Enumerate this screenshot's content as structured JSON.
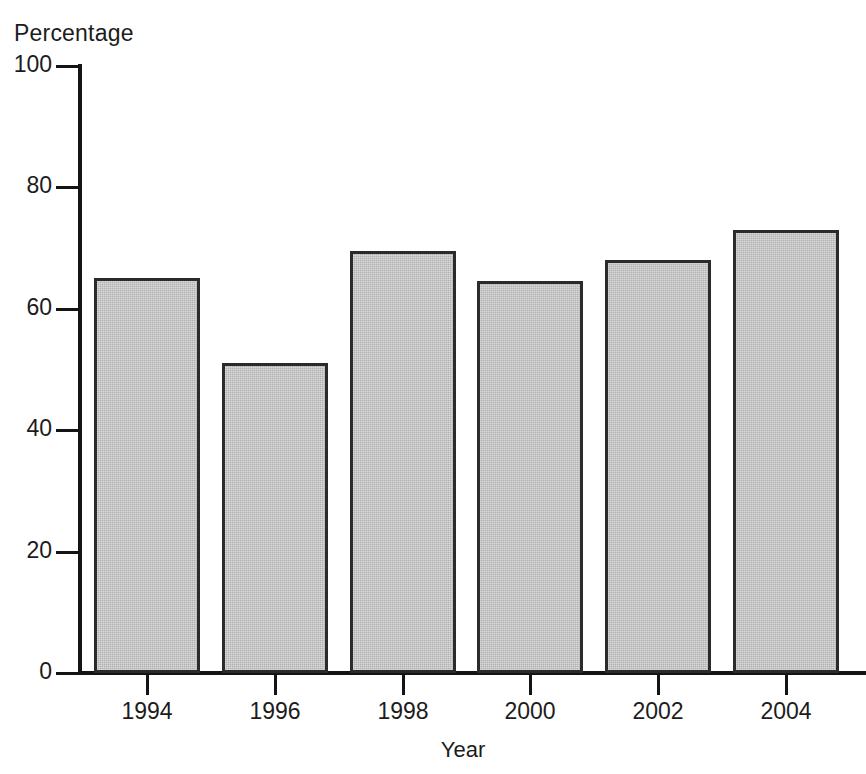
{
  "chart_data": {
    "type": "bar",
    "title": "",
    "xlabel": "Year",
    "ylabel": "Percentage",
    "categories": [
      "1994",
      "1996",
      "1998",
      "2000",
      "2002",
      "2004"
    ],
    "values": [
      65,
      51,
      69.5,
      64.5,
      68,
      73
    ],
    "series": [
      {
        "name": "Percentage",
        "values": [
          65,
          51,
          69.5,
          64.5,
          68,
          73
        ]
      }
    ],
    "ylim": [
      0,
      100
    ],
    "y_ticks": [
      0,
      20,
      40,
      60,
      80,
      100
    ],
    "y_tick_labels": [
      "0",
      "20",
      "40",
      "60",
      "80",
      "100"
    ],
    "x_tick_labels": [
      "1994",
      "1996",
      "1998",
      "2000",
      "2002",
      "2004"
    ],
    "grid": false,
    "legend": false,
    "legend_position": "none",
    "bar_fill_color": "#b2b2b2",
    "bar_edge_color": "#2b2b2b",
    "axis_color": "#141414",
    "background_color": "#ffffff"
  },
  "axes": {
    "y_title": "Percentage",
    "x_title": "Year"
  }
}
